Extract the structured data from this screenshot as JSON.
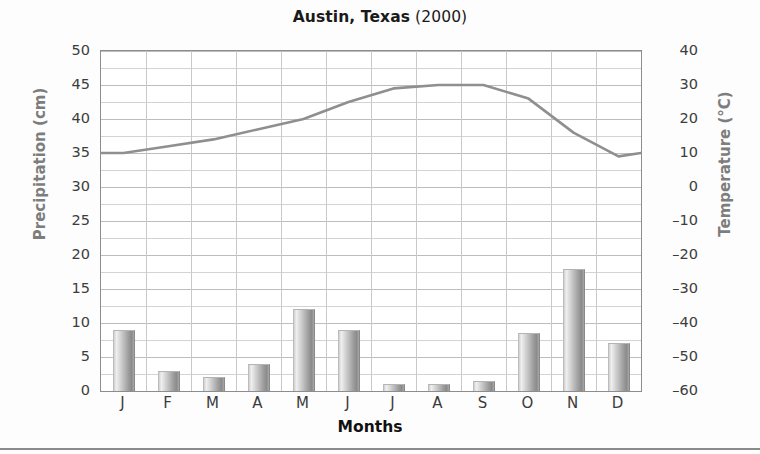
{
  "title": {
    "main": "Austin, Texas",
    "year": "(2000)"
  },
  "axes": {
    "left_label": "Precipitation (cm)",
    "right_label": "Temperature (°C)",
    "x_label": "Months",
    "left_ticks": [
      "50",
      "45",
      "40",
      "35",
      "30",
      "25",
      "20",
      "15",
      "10",
      "5",
      "0"
    ],
    "right_ticks": [
      "40",
      "30",
      "20",
      "10",
      "0",
      "–10",
      "–20",
      "–30",
      "–40",
      "–50",
      "–60"
    ]
  },
  "colors": {
    "bar_light": "#efefef",
    "bar_dark": "#8b8b8b",
    "line": "#8f8f8f",
    "grid": "#d3d3d3",
    "frame": "#8d8d8d",
    "axis_title": "#7d7d7d",
    "text": "#1a1a1a"
  },
  "chart_data": {
    "type": "bar",
    "title": "Austin, Texas (2000)",
    "xlabel": "Months",
    "ylabel": "Precipitation (cm)",
    "y2label": "Temperature (°C)",
    "categories": [
      "J",
      "F",
      "M",
      "A",
      "M",
      "J",
      "J",
      "A",
      "S",
      "O",
      "N",
      "D"
    ],
    "category_names": [
      "January",
      "February",
      "March",
      "April",
      "May",
      "June",
      "July",
      "August",
      "September",
      "October",
      "November",
      "December"
    ],
    "ylim": [
      0,
      50
    ],
    "y2lim": [
      -60,
      40
    ],
    "ytick_step": 5,
    "y2tick_step": 10,
    "grid": true,
    "legend": "none",
    "series": [
      {
        "name": "Precipitation (cm)",
        "type": "bar",
        "axis": "left",
        "units": "cm",
        "values": [
          9,
          3,
          2,
          4,
          12,
          9,
          1,
          1,
          1.5,
          8.5,
          18,
          7
        ]
      },
      {
        "name": "Temperature (°C)",
        "type": "line",
        "axis": "right",
        "units": "°C",
        "values": [
          10,
          12,
          14,
          17,
          20,
          25,
          29,
          30,
          30,
          26,
          16,
          9
        ]
      }
    ]
  }
}
